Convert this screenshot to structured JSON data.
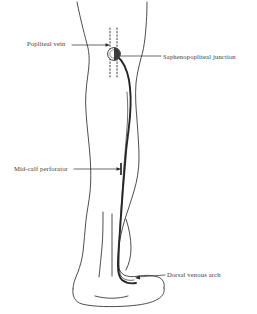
{
  "figure": {
    "view": "posterior-leg",
    "background_color": "#ffffff",
    "ink_color": "#2b2b2b",
    "text_color": "#3a3a3a"
  },
  "labels": [
    {
      "id": "popliteal-vein",
      "text": "Popliteal vein",
      "side": "left",
      "target": "dotted-vertical-vein-at-knee"
    },
    {
      "id": "saphenopopliteal-junction",
      "text": "Saphenopopliteal junction",
      "side": "right",
      "target": "half-filled-circle-at-knee"
    },
    {
      "id": "mid-calf-perforator",
      "text": "Mid-calf perforator",
      "side": "left",
      "target": "short-crossbar-on-saphenous-vein"
    },
    {
      "id": "dorsal-venous-arch",
      "text": "Dorsal venous arch",
      "side": "right",
      "target": "vein-terminus-at-foot"
    }
  ],
  "structures": [
    {
      "id": "leg-outline",
      "name": "Leg and foot outline",
      "style": "thin-contour"
    },
    {
      "id": "small-saphenous-vein",
      "name": "Small saphenous vein",
      "style": "thick-dark-line"
    },
    {
      "id": "popliteal-vein-dotted",
      "name": "Popliteal vein",
      "style": "dotted-vertical-pair"
    },
    {
      "id": "spj-marker",
      "name": "Saphenopopliteal junction",
      "style": "circle-half-filled"
    },
    {
      "id": "perforator-marker",
      "name": "Mid-calf perforator",
      "style": "horizontal-bar"
    }
  ]
}
